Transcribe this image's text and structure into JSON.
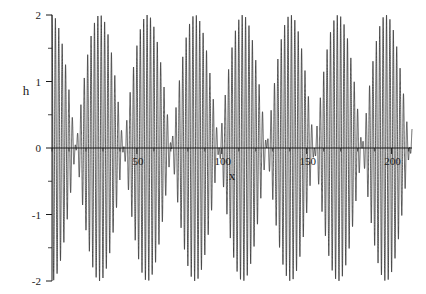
{
  "chart_data": {
    "type": "line",
    "title": "",
    "xlabel": "x",
    "ylabel": "h",
    "xlim": [
      0,
      212
    ],
    "ylim": [
      -2,
      2
    ],
    "grid": false,
    "legend": null,
    "xticks": [
      50,
      100,
      150,
      200
    ],
    "xtick_labels": [
      "50",
      "100",
      "150",
      "200"
    ],
    "yticks": [
      -2,
      -1,
      0,
      1,
      2
    ],
    "ytick_labels": [
      "-2",
      "-1",
      "0",
      "1",
      "2"
    ],
    "minor_ytick_step": 0.5,
    "minor_xtick_step": 10,
    "line_color": "#1a1a1a",
    "line_width": 0.7,
    "series": [
      {
        "name": "h",
        "expression": "cos(2*pi*x/1.9333) + cos(2*pi*x/2.0762)",
        "carrier_period": 2.0,
        "beat_period": 28.1,
        "amplitude_max": 2,
        "amplitude_min": 0,
        "node_x_values": [
          14.1,
          42.2,
          70.3,
          98.4,
          126.5,
          154.6,
          182.7,
          210.8
        ],
        "antinode_x_values": [
          0,
          28.1,
          56.2,
          84.3,
          112.4,
          140.5,
          168.6,
          196.7
        ]
      }
    ]
  },
  "axes": {
    "y_axis_name": "h",
    "x_axis_name": "x"
  }
}
